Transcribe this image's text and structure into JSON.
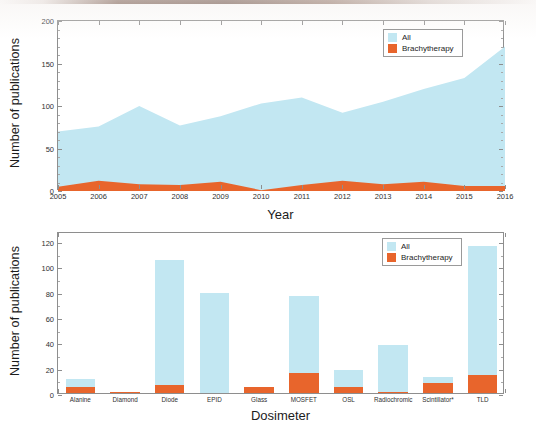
{
  "page": {
    "background_color": "#ffffff",
    "scan_edge_color": "#5c3d31"
  },
  "palette": {
    "all_color": "#c2e7f2",
    "brachytherapy_color": "#e8652c",
    "axis_color": "#8e8e8e",
    "text_color": "#1c1c1c"
  },
  "legend": {
    "all_label": "All",
    "brachytherapy_label": "Brachytherapy"
  },
  "chart_data": [
    {
      "id": "publications-by-year",
      "type": "area",
      "title": "",
      "xlabel": "Year",
      "ylabel": "Number of publications",
      "ylim": [
        0,
        200
      ],
      "yticks": [
        0,
        50,
        100,
        150,
        200
      ],
      "ytick_labels": [
        "0",
        "50",
        "100",
        "150",
        "200"
      ],
      "grid": false,
      "legend_position": "top-right",
      "categories": [
        "2005",
        "2006",
        "2007",
        "2008",
        "2009",
        "2010",
        "2011",
        "2012",
        "2013",
        "2014",
        "2015",
        "2016"
      ],
      "series": [
        {
          "name": "All",
          "color": "#c2e7f2",
          "values": [
            70,
            76,
            100,
            77,
            88,
            103,
            110,
            92,
            105,
            120,
            133,
            170
          ]
        },
        {
          "name": "Brachytherapy",
          "color": "#e8652c",
          "values": [
            5,
            12,
            8,
            7,
            11,
            1,
            7,
            12,
            8,
            11,
            6,
            6
          ]
        }
      ]
    },
    {
      "id": "publications-by-dosimeter",
      "type": "bar",
      "title": "",
      "xlabel": "Dosimeter",
      "ylabel": "Number of publications",
      "ylim": [
        0,
        128
      ],
      "yticks": [
        0,
        20,
        40,
        60,
        80,
        100,
        120
      ],
      "ytick_labels": [
        "0",
        "20",
        "40",
        "60",
        "80",
        "100",
        "120"
      ],
      "grid": false,
      "legend_position": "top-right",
      "categories": [
        "Alanine",
        "Diamond",
        "Diode",
        "EPID",
        "Glass",
        "MOSFET",
        "OSL",
        "Radiochromic",
        "Scintillator*",
        "TLD"
      ],
      "series": [
        {
          "name": "All",
          "color": "#c2e7f2",
          "values": [
            11,
            1,
            105,
            79,
            5,
            77,
            18,
            38,
            13,
            116
          ]
        },
        {
          "name": "Brachytherapy",
          "color": "#e8652c",
          "values": [
            5,
            1,
            6,
            0,
            5,
            16,
            5,
            1,
            8,
            14
          ]
        }
      ]
    }
  ]
}
